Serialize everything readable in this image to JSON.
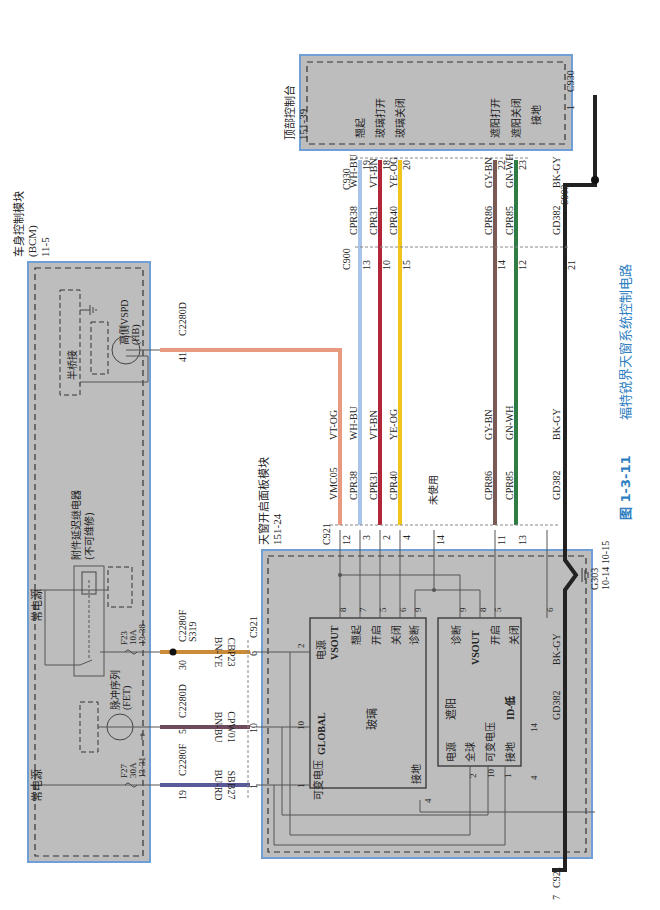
{
  "caption": {
    "figure_no": "图 1-3-11",
    "title": "福特锐界天窗系统控制电路"
  },
  "modules": {
    "bcm": {
      "name": "车身控制模块",
      "abbr": "(BCM)",
      "page": "11-5",
      "half_bridge": "半桥接",
      "high_side": "高侧VSPD",
      "high_side_sub": "(HB)",
      "relay": "附件延迟继电器",
      "relay_sub": "(不可维修)",
      "pulse": "脉冲序列",
      "pulse_sub": "(FET)",
      "power_top": "常电源",
      "power_bottom": "常电源",
      "fuse_f23": [
        "F23",
        "10A",
        "13-38"
      ],
      "fuse_f27": [
        "F27",
        "30A",
        "13-31"
      ]
    },
    "sunroof_panel": {
      "name": "天窗开启面板模块",
      "page": "151-24",
      "glass_block": {
        "title": "玻璃",
        "global": "GLOBAL",
        "power": "电源",
        "vsout": "VSOUT",
        "tilt": "翘起",
        "open": "开启",
        "close": "关闭",
        "diag": "诊断",
        "var_voltage": "可变电压",
        "ground": "接地"
      },
      "shade_block": {
        "title": "遮阳",
        "diag": "诊断",
        "vsout": "VSOUT",
        "open": "开启",
        "close": "关闭",
        "power": "电源",
        "global": "全球",
        "var_voltage": "可变电压",
        "ground": "接地",
        "id_low": "ID-低"
      },
      "unused": "未使用"
    },
    "overhead_console": {
      "name": "顶部控制台",
      "page": "151-39",
      "pins": {
        "tilt": "翘起",
        "glass_open": "玻璃打开",
        "glass_close": "玻璃关闭",
        "shade_open": "遮阳打开",
        "shade_close": "遮阳关闭",
        "ground": "接地"
      }
    }
  },
  "connectors": {
    "c2280d_a": "C2280D",
    "c2280d_b": "C2280D",
    "c2280f_a": "C2280F",
    "c2280f_b": "C2280F",
    "s319": "S319",
    "c921_a": "C921",
    "c921_b": "C921",
    "c921_c": "C921",
    "c900": "C900",
    "c930_a": "C930",
    "c930_b": "C930",
    "s903": "S903",
    "g303": "G303",
    "g303_pages": "10-14  10-15"
  },
  "wires": {
    "vmc05": {
      "circuit": "VMC05",
      "color_code": "VT-OG",
      "color": "#e89a80"
    },
    "cpr38": {
      "circuit": "CPR38",
      "color_code": "WH-BU",
      "color": "#a9c4e8"
    },
    "cpr31": {
      "circuit": "CPR31",
      "color_code": "VT-BN",
      "color": "#b3263a"
    },
    "cpr40": {
      "circuit": "CPR40",
      "color_code": "YE-OG",
      "color": "#f0c419"
    },
    "cpr86": {
      "circuit": "CPR86",
      "color_code": "GY-BN",
      "color": "#7a5a52"
    },
    "cpr85": {
      "circuit": "CPR85",
      "color_code": "GN-WH",
      "color": "#2f7d45"
    },
    "gd382": {
      "circuit": "GD382",
      "color_code": "BK-GY",
      "color": "#222222"
    },
    "cbp23": {
      "circuit": "CBP23",
      "color_code": "BN-YE",
      "color": "#c98a3a"
    },
    "cpw01": {
      "circuit": "CPW01",
      "color_code": "BN-BU",
      "color": "#6d4a5e"
    },
    "sbb27": {
      "circuit": "SBB27",
      "color_code": "BU-RD",
      "color": "#5a5a9a"
    }
  },
  "pins": {
    "bcm_41": "41",
    "bcm_30": "30",
    "bcm_5": "5",
    "bcm_19": "19",
    "c921_6": "6",
    "c921_10": "10",
    "c921_1": "1",
    "c921_12": "12",
    "c921_3": "3",
    "c921_2": "2",
    "c921_4": "4",
    "c921_14": "14",
    "c921_11": "11",
    "c921_13": "13",
    "c921_7": "7",
    "c900_13": "13",
    "c900_10": "10",
    "c900_15": "15",
    "c900_14": "14",
    "c900_12": "12",
    "c900_21": "21",
    "c930_19": "19",
    "c930_18": "18",
    "c930_20": "20",
    "c930_22": "22",
    "c930_23": "23",
    "c930_1": "1",
    "glass_8": "8",
    "glass_7": "7",
    "glass_5": "5",
    "glass_6": "6",
    "glass_9": "9",
    "glass_2": "2",
    "glass_10": "10",
    "glass_1": "1",
    "glass_4": "4",
    "shade_9": "9",
    "shade_8": "8",
    "shade_5": "5",
    "shade_6": "6",
    "shade_2": "2",
    "shade_10": "10",
    "shade_1": "1",
    "shade_4": "4",
    "shade_14": "14"
  },
  "colors": {
    "module_fill": "#bdbdbd",
    "module_border": "#6e9fd6",
    "caption": "#2f7fc1"
  }
}
